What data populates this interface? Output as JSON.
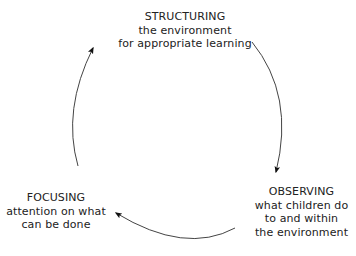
{
  "diagram": {
    "type": "cycle",
    "nodes": [
      {
        "id": "structuring",
        "title": "STRUCTURING",
        "lines": [
          "the environment",
          "for appropriate learning"
        ]
      },
      {
        "id": "observing",
        "title": "OBSERVING",
        "lines": [
          "what children do",
          "to and within",
          "the environment"
        ]
      },
      {
        "id": "focusing",
        "title": "FOCUSING",
        "lines": [
          "attention on what",
          "can be done"
        ]
      }
    ],
    "edges": [
      {
        "from": "structuring",
        "to": "observing",
        "style": "curved-arrow"
      },
      {
        "from": "observing",
        "to": "focusing",
        "style": "curved-arrow"
      },
      {
        "from": "focusing",
        "to": "structuring",
        "style": "curved-arrow"
      }
    ],
    "colors": {
      "text": "#222222",
      "arrow": "#333333",
      "background": "#ffffff"
    }
  }
}
